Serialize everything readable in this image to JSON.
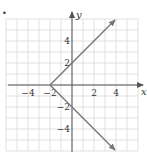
{
  "figure": {
    "bullet": "•"
  },
  "chart_data": {
    "type": "line",
    "title": "",
    "xlabel": "x",
    "ylabel": "y",
    "xlim": [
      -6,
      6
    ],
    "ylim": [
      -6,
      6
    ],
    "grid": true,
    "grid_step": 1,
    "x_ticks": [
      {
        "value": -4,
        "label": "−4"
      },
      {
        "value": -2,
        "label": "−2"
      },
      {
        "value": 2,
        "label": "2"
      },
      {
        "value": 4,
        "label": "4"
      }
    ],
    "y_ticks": [
      {
        "value": 4,
        "label": "4"
      },
      {
        "value": 2,
        "label": "2"
      },
      {
        "value": -2,
        "label": "−2"
      },
      {
        "value": -4,
        "label": "−4"
      }
    ],
    "series": [
      {
        "name": "upper ray",
        "points": [
          [
            -2,
            0
          ],
          [
            3.9,
            5.9
          ]
        ],
        "arrow_end": true
      },
      {
        "name": "lower ray",
        "points": [
          [
            -2,
            0
          ],
          [
            3.9,
            -5.9
          ]
        ],
        "arrow_end": true
      }
    ],
    "vertex": [
      -2,
      0
    ],
    "colors": {
      "grid": "#d9d9d9",
      "axis": "#555555",
      "curve": "#777777"
    }
  }
}
